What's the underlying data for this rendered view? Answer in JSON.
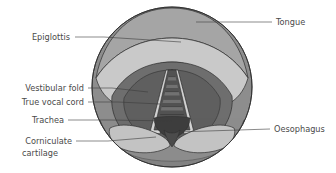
{
  "figure": {
    "background_color": "#ffffff",
    "width": 336,
    "height": 173
  },
  "diagram": {
    "shape": "circle",
    "center_x": 172,
    "center_y": 87,
    "radius": 80,
    "view_type": "laryngoscopic-view"
  },
  "palette": {
    "outer_ring": "#8d8d8d",
    "tongue": "#a5a5a5",
    "epiglottis": "#c9c9c9",
    "vestibular_fold": "#6e6e6e",
    "true_vocal_cord": "#d3d3d3",
    "trachea_dark": "#545454",
    "trachea_ring": "#7b7b7b",
    "trachea_deep": "#404040",
    "corniculate_cartilage": "#c4c4c4",
    "oesophagus_notch": "#4c4c4c",
    "outline": "#2e2e2e",
    "leader_line": "#3c3c3c",
    "label_text": "#4a4a4a"
  },
  "labels": [
    {
      "id": "tongue",
      "text": "Tongue",
      "side": "right",
      "text_x": 276,
      "text_y": 22,
      "leader": {
        "x1": 272,
        "y1": 22,
        "x2": 196,
        "y2": 22
      },
      "anchor": "start"
    },
    {
      "id": "epiglottis",
      "text": "Epiglottis",
      "side": "left",
      "text_x": 70,
      "text_y": 37,
      "leader_points": "75,37 104,37 181,42",
      "anchor": "end"
    },
    {
      "id": "vestibular-fold",
      "text": "Vestibular fold",
      "side": "left",
      "text_x": 84,
      "text_y": 88,
      "leader_points": "88,88 112,88 148,92",
      "anchor": "end"
    },
    {
      "id": "true-vocal-cord",
      "text": "True vocal cord",
      "side": "left",
      "text_x": 84,
      "text_y": 102,
      "leader_points": "88,102 118,102 160,104",
      "anchor": "end"
    },
    {
      "id": "trachea",
      "text": "Trachea",
      "side": "left",
      "text_x": 64,
      "text_y": 120,
      "leader_points": "68,120 110,120 172,121",
      "anchor": "end"
    },
    {
      "id": "corniculate-cartilage",
      "text": "Corniculate",
      "text_line2": "cartilage",
      "side": "left",
      "text_x": 72,
      "text_y": 141,
      "text_line2_x": 58,
      "text_line2_y": 153,
      "leader_points": "76,141 108,141 156,137",
      "anchor": "end"
    },
    {
      "id": "oesophagus",
      "text": "Oesophagus",
      "side": "right",
      "text_x": 274,
      "text_y": 129,
      "leader": {
        "x1": 270,
        "y1": 129,
        "x2": 176,
        "y2": 132
      },
      "anchor": "start"
    }
  ]
}
